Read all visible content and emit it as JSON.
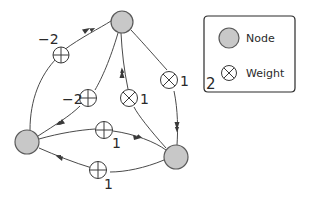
{
  "colors": {
    "node_fill": "#c8c8c8",
    "node_stroke": "#5a5a5a",
    "edge": "#4a4a4a",
    "weight_stroke": "#3a3a3a",
    "text": "#2a2a2a"
  },
  "nodes": [
    {
      "id": "top",
      "cx": 122,
      "cy": 22,
      "r": 11
    },
    {
      "id": "left",
      "cx": 27,
      "cy": 142,
      "r": 12
    },
    {
      "id": "right",
      "cx": 176,
      "cy": 157,
      "r": 12
    }
  ],
  "edges": [
    {
      "from": "left",
      "to": "top",
      "weight": "-2",
      "weight_icon": "plus-circle-icon"
    },
    {
      "from": "top",
      "to": "left",
      "weight": "-2",
      "weight_icon": "plus-circle-icon"
    },
    {
      "from": "right",
      "to": "top",
      "weight": "1",
      "weight_icon": "cross-circle-icon"
    },
    {
      "from": "top",
      "to": "right",
      "weight": "1",
      "weight_icon": "cross-circle-icon"
    },
    {
      "from": "left",
      "to": "right",
      "weight": "1",
      "weight_icon": "plus-circle-icon"
    },
    {
      "from": "right",
      "to": "left",
      "weight": "1",
      "weight_icon": "plus-circle-icon"
    }
  ],
  "weight_labels": {
    "left_top": "−2",
    "top_left": "−2",
    "right_top": "1",
    "top_right": "1",
    "left_right": "1",
    "right_left": "1"
  },
  "legend": {
    "node_label": "Node",
    "weight_label": "Weight",
    "figure_number": "2"
  }
}
